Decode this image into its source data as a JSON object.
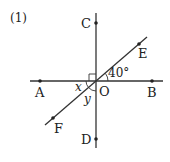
{
  "problem_label": "(1)",
  "points": {
    "A": "A",
    "B": "B",
    "C": "C",
    "D": "D",
    "E": "E",
    "F": "F",
    "O": "O"
  },
  "angles": {
    "x": "x",
    "y": "y",
    "given": "40°"
  },
  "colors": {
    "line": "#333333",
    "text": "#222222"
  }
}
